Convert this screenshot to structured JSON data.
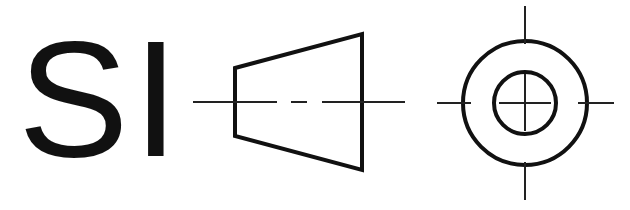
{
  "symbol": {
    "title": "First-angle projection symbol",
    "label": "SI",
    "colors": {
      "stroke": "#111111",
      "background": "#ffffff"
    },
    "front_view": {
      "shape": "truncated-cone-side",
      "left_edge": {
        "x": 234,
        "y1": 68,
        "y2": 136
      },
      "right_edge": {
        "x": 362,
        "y1": 34,
        "y2": 170
      },
      "centerline_y": 102
    },
    "side_view": {
      "shape": "concentric-circles",
      "center": [
        525,
        103
      ],
      "outer_radius": 62,
      "inner_radius": 31
    }
  }
}
